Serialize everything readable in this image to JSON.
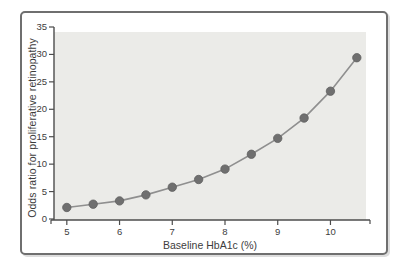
{
  "chart_data": {
    "type": "line",
    "title": "",
    "xlabel": "Baseline HbA1c (%)",
    "ylabel": "Odds ratio for proliferative retinopathy",
    "x": [
      5.0,
      5.5,
      6.0,
      6.5,
      7.0,
      7.5,
      8.0,
      8.5,
      9.0,
      9.5,
      10.0,
      10.5
    ],
    "values": [
      2.1,
      2.7,
      3.3,
      4.4,
      5.8,
      7.2,
      9.1,
      11.8,
      14.7,
      18.4,
      23.3,
      29.4
    ],
    "xlim": [
      4.7,
      10.75
    ],
    "ylim": [
      0,
      35
    ],
    "x_ticks": [
      5,
      6,
      7,
      8,
      9,
      10
    ],
    "y_ticks": [
      0,
      5,
      10,
      15,
      20,
      25,
      30,
      35
    ],
    "grid": false,
    "legend": "none",
    "marker": "circle",
    "colors": {
      "plot_background": "#ebebe8",
      "line": "#8f8f8f",
      "marker_fill": "#6f6f6f",
      "marker_stroke": "#5f5f5f",
      "axis": "#4c4c4c",
      "tick_text": "#3d3d3d",
      "frame_border": "#6f6f6f",
      "figure_background": "#ffffff"
    }
  }
}
